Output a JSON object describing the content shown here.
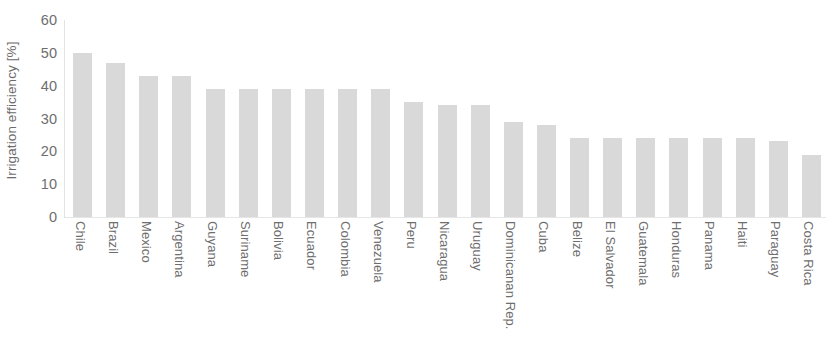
{
  "chart_data": {
    "type": "bar",
    "title": "",
    "xlabel": "",
    "ylabel": "Irrigation efficiency [%]",
    "ylim": [
      0,
      60
    ],
    "yticks": [
      0,
      10,
      20,
      30,
      40,
      50,
      60
    ],
    "grid": false,
    "legend": "none",
    "orientation": "vertical",
    "bar_color": "#d9d9d9",
    "categories": [
      "Chile",
      "Brazil",
      "Mexico",
      "Argentina",
      "Guyana",
      "Suriname",
      "Bolivia",
      "Ecuador",
      "Colombia",
      "Venezuela",
      "Peru",
      "Nicaragua",
      "Uruguay",
      "Dominicanan Rep.",
      "Cuba",
      "Belize",
      "El Salvador",
      "Guatemala",
      "Honduras",
      "Panama",
      "Haiti",
      "Paraguay",
      "Costa Rica"
    ],
    "values": [
      50,
      47,
      43,
      43,
      39,
      39,
      39,
      39,
      39,
      39,
      35,
      34,
      34,
      29,
      28,
      24,
      24,
      24,
      24,
      24,
      24,
      23,
      19
    ]
  },
  "axis": {
    "y_title": "Irrigation efficiency [%]"
  }
}
